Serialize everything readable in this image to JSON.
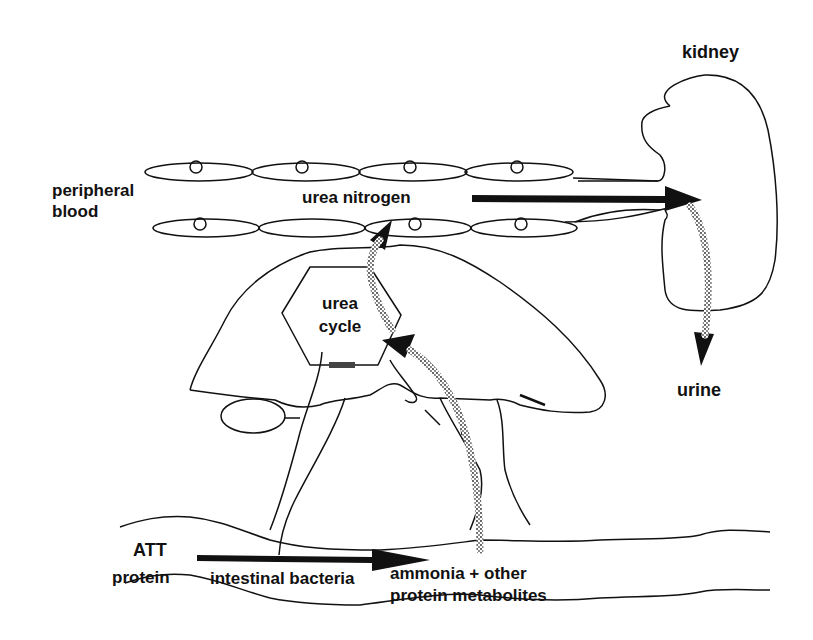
{
  "diagram": {
    "colors": {
      "ink": "#111111",
      "background": "#ffffff"
    },
    "labels": {
      "kidney": "kidney",
      "peripheral_blood_line1": "peripheral",
      "peripheral_blood_line2": "blood",
      "urea_nitrogen": "urea nitrogen",
      "urea_cycle_line1": "urea",
      "urea_cycle_line2": "cycle",
      "urine": "urine",
      "att_line1": "ATT",
      "att_line2": "protein",
      "intestinal_bacteria": "intestinal bacteria",
      "ammonia_line1": "ammonia + other",
      "ammonia_line2": "protein metabolites"
    },
    "organs": [
      "kidney",
      "liver",
      "intestine",
      "blood vessel"
    ],
    "arrows": [
      {
        "from": "ATT protein",
        "to": "ammonia + other protein metabolites",
        "via": "intestinal bacteria",
        "style": "solid"
      },
      {
        "from": "ammonia + other protein metabolites",
        "to": "urea cycle",
        "style": "dotted"
      },
      {
        "from": "urea cycle",
        "to": "urea nitrogen",
        "style": "dotted"
      },
      {
        "from": "urea nitrogen",
        "to": "kidney",
        "style": "solid"
      },
      {
        "from": "kidney",
        "to": "urine",
        "style": "dotted"
      }
    ]
  }
}
